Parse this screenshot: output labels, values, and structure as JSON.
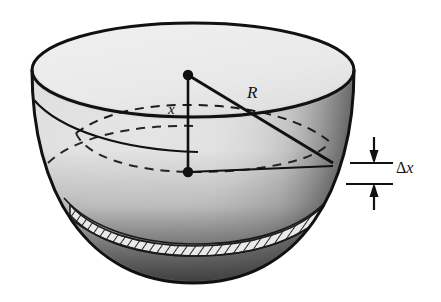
{
  "figure": {
    "type": "geometry-diagram",
    "shape": "hemisphere-bowl",
    "width": 441,
    "height": 302,
    "background_color": "#ffffff",
    "ink_color": "#111111"
  },
  "labels": {
    "radius": "R",
    "depth": "x",
    "slab_thickness_delta": "Δ",
    "slab_thickness_var": "x",
    "slab_thickness": "Δx"
  },
  "annotations": {
    "top_center_dot": "sphere-center-point",
    "lower_center_dot": "cross-section-center-point",
    "radius_line": "R-from-center-to-rim",
    "depth_line": "x-vertical-from-center-down",
    "cross_section_radius_line": "horizontal-radius-at-depth-x",
    "dashed_ellipse": "hidden-cross-section-circle",
    "hatched_band": "delta-x-slab",
    "dimension_ticks": 2,
    "dimension_arrows": 2
  },
  "geometry": {
    "rim_center_x": 193,
    "rim_center_y": 70,
    "rim_radius_x": 161,
    "rim_radius_y": 47,
    "bowl_bottom_y": 283,
    "top_dot": {
      "x": 188,
      "y": 75
    },
    "lower_dot": {
      "x": 188,
      "y": 172
    },
    "radius_endpoint": {
      "x": 331,
      "y": 160
    },
    "tick_upper_y": 162,
    "tick_lower_y": 184,
    "tick_left_x": 352,
    "tick_right_x": 392
  },
  "colors": {
    "outline": "#111111",
    "interior_light": "#ebebeb",
    "interior_mid": "#bdbdbd",
    "shade_dark": "#4a4a4a",
    "shade_darkest": "#1b1b1b",
    "hatch": "#2b2b2b"
  }
}
